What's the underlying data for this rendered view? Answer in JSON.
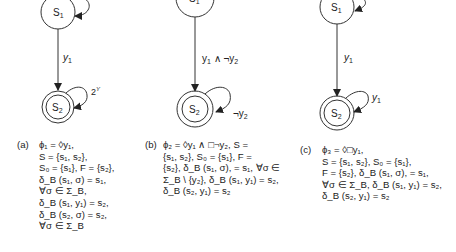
{
  "figure": {
    "panels": [
      {
        "id": "a",
        "label": "(a)",
        "states": {
          "s1": "S1",
          "s2": "S2"
        },
        "transition_label": "y1",
        "self_loop_s2": "2^Y",
        "caption_lines": [
          "ϕ₁ = ◊y₁,",
          "S = {s₁, s₂},",
          "S₀ = {s₁}, F = {s₂},",
          "δ_B (s₁, σ) = s₁,",
          "∀σ ∈ Σ_B,",
          "δ_B (s₁, y₁) = s₂,",
          "δ_B (s₂, σ) = s₂,",
          "∀σ ∈ Σ_B"
        ]
      },
      {
        "id": "b",
        "label": "(b)",
        "states": {
          "s1": "S1",
          "s2": "S2"
        },
        "transition_label": "y1 ∧ ¬y2",
        "self_loop_s2": "¬y2",
        "caption_lines": [
          "ϕ₂ = ◊y₁ ∧ □¬y₂, S =",
          "{s₁, s₂}, S₀ = {s₁}, F =",
          "{s₂}, δ_B (s₁, σ), = s₁, ∀σ ∈",
          "Σ_B \\ {y₂}, δ_B (s₁, y₁) = s₂,",
          "δ_B (s₂, y₁) = s₂"
        ]
      },
      {
        "id": "c",
        "label": "(c)",
        "states": {
          "s1": "S1",
          "s2": "S2"
        },
        "transition_label": "y1",
        "self_loop_s2": "y1",
        "caption_lines": [
          "ϕ₃ = ◊□y₁,",
          "S = {s₁, s₂}, S₀ = {s₁},",
          "F = {s₂}, δ_B (s₁, σ), = s₁,",
          "∀σ ∈ Σ_B, δ_B (s₁, y₁) = s₂,",
          "δ_B (s₂, y₁) = s₂"
        ]
      }
    ]
  }
}
